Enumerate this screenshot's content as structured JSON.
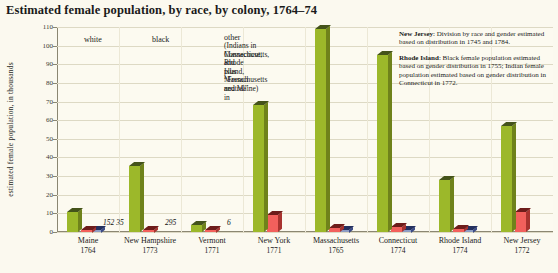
{
  "title": "Estimated female population, by race, by colony, 1764–74",
  "axis": {
    "ylabel": "estimated female population, in thousands",
    "yticks": [
      "0",
      "10",
      "20",
      "30",
      "40",
      "50",
      "60",
      "70",
      "80",
      "90",
      "100",
      "110"
    ]
  },
  "legend": {
    "white": "white",
    "black": "black",
    "other": "other",
    "other_detail_1": "(Indians in Connecticut,",
    "other_detail_2": "Massachusetts, and",
    "other_detail_3": "Rhode Island,",
    "other_detail_4": "plus “French neutral” in",
    "other_detail_5": "Massachusetts and Maine)"
  },
  "notes": [
    {
      "label": "New Jersey",
      "text": ": Division by race and gender estimated based on distribution in 1745 and 1784."
    },
    {
      "label": "Rhode Island",
      "text": ": Black female population estimated based on gender distribution in 1755; Indian female population estimated based on gender distribution in Connecticut in 1772."
    }
  ],
  "chart_data": {
    "type": "bar",
    "title": "Estimated female population, by race, by colony, 1764–74",
    "xlabel": "",
    "ylabel": "estimated female population, in thousands",
    "ylim": [
      0,
      110
    ],
    "grid": true,
    "legend_position": "top-left",
    "categories": [
      "Maine",
      "New Hampshire",
      "Vermont",
      "New York",
      "Massachusetts",
      "Connecticut",
      "Rhode Island",
      "New Jersey"
    ],
    "years": [
      "1764",
      "1773",
      "1771",
      "1771",
      "1765",
      "1774",
      "1774",
      "1772"
    ],
    "series": [
      {
        "name": "white",
        "color": "#9cb82a",
        "values": [
          10.5,
          35.5,
          3.5,
          68.0,
          109.0,
          95.0,
          28.0,
          57.0
        ]
      },
      {
        "name": "black",
        "color": "#f2605c",
        "values": [
          0.152,
          0.295,
          0.006,
          9.0,
          2.2,
          2.6,
          1.8,
          10.5
        ]
      },
      {
        "name": "other",
        "color": "#8d9dc4",
        "values": [
          0.035,
          0,
          0,
          0,
          0.6,
          0.7,
          0.6,
          0
        ]
      }
    ],
    "point_labels": [
      {
        "category": "Maine",
        "text": "152  35"
      },
      {
        "category": "New Hampshire",
        "text": "295"
      },
      {
        "category": "Vermont",
        "text": "6"
      }
    ]
  }
}
